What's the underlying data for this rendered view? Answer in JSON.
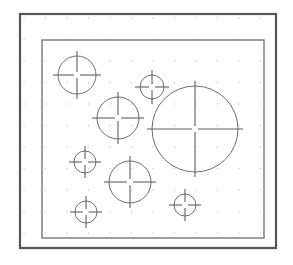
{
  "drawing": {
    "title": "Technical Drawing - Circular Hole Pattern",
    "view_type": "plan-view",
    "canvas": {
      "width": 293,
      "height": 265,
      "background": "#ffffff"
    },
    "colors": {
      "outer_border": "#555555",
      "inner_border": "#777777",
      "circle_stroke": "#6e6e6e",
      "center_mark": "#5f5f5f",
      "grid_dot": "#c8c8c8",
      "background": "#ffffff"
    },
    "outer_border": {
      "label": "Sheet Border",
      "x": 20,
      "y": 14,
      "width": 256,
      "height": 234,
      "stroke_width": 2.2
    },
    "inner_border": {
      "label": "Drawing Frame",
      "x": 42,
      "y": 40,
      "width": 222,
      "height": 198,
      "stroke_width": 1.4
    },
    "grid": {
      "label": "Snap Grid",
      "visible": true,
      "origin_x": 24,
      "origin_y": 18,
      "spacing_x": 21.5,
      "spacing_y": 21.5,
      "columns": 12,
      "rows": 11,
      "dot_radius": 0.7
    },
    "center_mark_style": {
      "overshoot": 5,
      "center_gap": 3,
      "stroke_width": 1.1
    },
    "circles": [
      {
        "id": "C1",
        "name": "circle-top-left",
        "cx": 77,
        "cy": 75,
        "r": 19,
        "stroke_width": 1.0
      },
      {
        "id": "C2",
        "name": "circle-upper-middle",
        "cx": 152,
        "cy": 87,
        "r": 12,
        "stroke_width": 1.0
      },
      {
        "id": "C3",
        "name": "circle-center-left",
        "cx": 118,
        "cy": 118,
        "r": 21,
        "stroke_width": 1.0
      },
      {
        "id": "C4",
        "name": "circle-large-right",
        "cx": 195,
        "cy": 129,
        "r": 43,
        "stroke_width": 1.0
      },
      {
        "id": "C5",
        "name": "circle-mid-left-small",
        "cx": 85,
        "cy": 162,
        "r": 11,
        "stroke_width": 1.0
      },
      {
        "id": "C6",
        "name": "circle-lower-middle",
        "cx": 130,
        "cy": 182,
        "r": 21,
        "stroke_width": 1.0
      },
      {
        "id": "C7",
        "name": "circle-bottom-right",
        "cx": 185,
        "cy": 205,
        "r": 11,
        "stroke_width": 1.0
      },
      {
        "id": "C8",
        "name": "circle-bottom-left",
        "cx": 86,
        "cy": 212,
        "r": 11,
        "stroke_width": 1.0
      }
    ]
  }
}
